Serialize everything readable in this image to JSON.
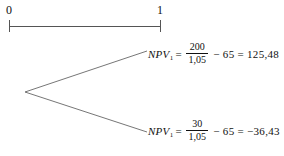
{
  "figure": {
    "background_color": "#ffffff",
    "line_color": "#555555",
    "text_color": "#111111"
  },
  "timeline": {
    "ticks": [
      {
        "label": "0",
        "x": 9
      },
      {
        "label": "1",
        "x": 160
      }
    ],
    "axis_y": 26,
    "tick_half_height": 6
  },
  "tree": {
    "node_x": 25,
    "node_y": 92,
    "branches": [
      {
        "name": "upper-branch",
        "end_x": 147,
        "end_y": 51
      },
      {
        "name": "lower-branch",
        "end_x": 147,
        "end_y": 132
      }
    ]
  },
  "formulas": {
    "upper": {
      "symbol": "NPV",
      "subscript": "1",
      "equals": "=",
      "numerator": "200",
      "denominator": "1,05",
      "tail": "− 65 = 125,48"
    },
    "lower": {
      "symbol": "NPV",
      "subscript": "1",
      "equals": "=",
      "numerator": "30",
      "denominator": "1,05",
      "tail": "− 65 = −36,43"
    }
  },
  "caption": {
    "text": ""
  }
}
